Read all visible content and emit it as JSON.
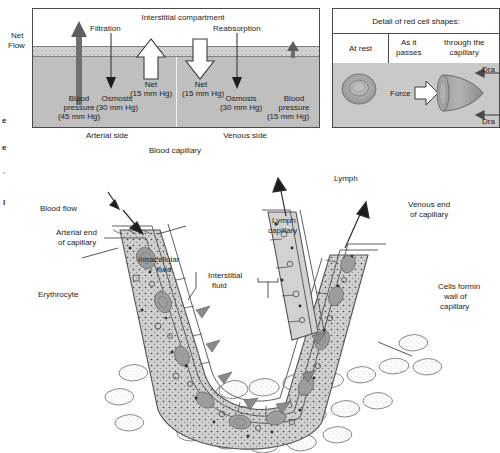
{
  "figure": {
    "panel_top_left": {
      "title_interstitial": "Interstitial compartment",
      "net_flow_line1": "Net",
      "net_flow_line2": "Flow",
      "filtration": "Filtration",
      "reabsorption": "Reabsorption",
      "net_left_line1": "Net",
      "net_left_line2": "(15 mm Hg)",
      "net_right_line1": "Net",
      "net_right_line2": "(15 mm Hg)",
      "blood_pressure_left_line1": "Blood",
      "blood_pressure_left_line2": "pressure",
      "blood_pressure_left_line3": "(45 mm Hg)",
      "osmosis_left_line1": "Osmosis",
      "osmosis_left_line2": "(30 mm Hg)",
      "osmosis_right_line1": "Osmosis",
      "osmosis_right_line2": "(30 mm Hg)",
      "blood_pressure_right_line1": "Blood",
      "blood_pressure_right_line2": "pressure",
      "blood_pressure_right_line3": "(15 mm Hg)",
      "arterial_side": "Arterial side",
      "venous_side": "Venous side",
      "caption": "Blood capillary"
    },
    "panel_top_right": {
      "title": "Detail of red cell shapes:",
      "col1_header": "At rest",
      "col2_header_line1": "As it passes",
      "col2_header_line2": "through the capillary",
      "force_label": "Force",
      "drag_top": "Dra",
      "drag_bottom": "Dra"
    },
    "panel_main": {
      "blood_flow": "Blood flow",
      "arterial_end_line1": "Arterial end",
      "arterial_end_line2": "of capillary",
      "erythrocyte": "Erythrocyte",
      "intracellular_line1": "Intracellular",
      "intracellular_line2": "fluid",
      "interstitial_line1": "Interstitial",
      "interstitial_line2": "fluid",
      "lymph": "Lymph",
      "lymph_capillary_line1": "Lymph",
      "lymph_capillary_line2": "capillary",
      "venous_end_line1": "Venous end",
      "venous_end_line2": "of capillary",
      "cells_wall_line1": "Cells formin",
      "cells_wall_line2": "wall of",
      "cells_wall_line3": "capillary"
    },
    "margin_scraps": {
      "s1": "e",
      "s2": "e",
      "s3": ",",
      "s4": "l"
    },
    "colors": {
      "blood_gray": "#bfbfbf",
      "membrane_gray": "#d8d8d8",
      "cell_gray": "#c9c9c9",
      "ink": "#1d1d1d",
      "paper": "#ffffff"
    }
  }
}
